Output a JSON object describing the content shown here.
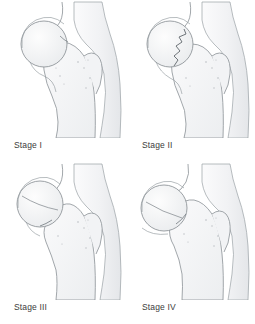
{
  "figure": {
    "background_color": "#ffffff",
    "caption_color": "#3b3b3b",
    "line_color": "#8a8f94",
    "fill_light": "#f5f6f7",
    "fill_shadow": "#e8eaec",
    "panel_count": 4,
    "grid": "2x2"
  },
  "panels": [
    {
      "id": "stage-1",
      "caption": "Stage I",
      "anatomy": "hip joint, proximal femur, incomplete impacted femoral neck fracture"
    },
    {
      "id": "stage-2",
      "caption": "Stage II",
      "anatomy": "hip joint, proximal femur, complete undisplaced femoral neck fracture"
    },
    {
      "id": "stage-3",
      "caption": "Stage III",
      "anatomy": "hip joint, proximal femur, complete partially displaced femoral neck fracture"
    },
    {
      "id": "stage-4",
      "caption": "Stage IV",
      "anatomy": "hip joint, proximal femur, complete fully displaced femoral neck fracture"
    }
  ]
}
